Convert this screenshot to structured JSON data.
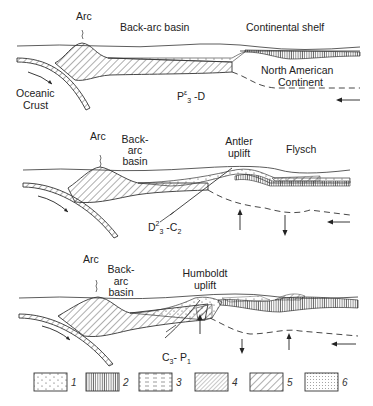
{
  "panels": [
    {
      "id": "panel-1",
      "age": {
        "base": "P",
        "sup": "ε",
        "sub": "3",
        "rest": " -D"
      },
      "labels": {
        "arc": "Arc",
        "back_arc_basin": "Back-arc basin",
        "continental_shelf": "Continental shelf",
        "continent_line1": "North  American",
        "continent_line2": "Continent",
        "oceanic_line1": "Oceanic",
        "oceanic_line2": "Crust"
      }
    },
    {
      "id": "panel-2",
      "age": {
        "base": "D",
        "sup": "2",
        "sub": "3",
        "rest": " -C",
        "sub2": "2"
      },
      "labels": {
        "arc": "Arc",
        "back_arc_line1": "Back-",
        "back_arc_line2": "arc",
        "back_arc_line3": "basin",
        "uplift_line1": "Antler",
        "uplift_line2": "uplift",
        "flysch": "Flysch"
      }
    },
    {
      "id": "panel-3",
      "age": {
        "base": "C",
        "sub": "3",
        "rest": "- P",
        "sub2": "1"
      },
      "labels": {
        "arc": "Arc",
        "back_arc_line1": "Back-",
        "back_arc_line2": "arc",
        "back_arc_line3": "basin",
        "uplift_line1": "Humboldt",
        "uplift_line2": "uplift"
      }
    }
  ],
  "legend": [
    {
      "num": "1",
      "pattern": "sparse-dots"
    },
    {
      "num": "2",
      "pattern": "vertical-lines"
    },
    {
      "num": "3",
      "pattern": "dashes"
    },
    {
      "num": "4",
      "pattern": "dense-crosshatch"
    },
    {
      "num": "5",
      "pattern": "diagonal-lines"
    },
    {
      "num": "6",
      "pattern": "dense-dots"
    }
  ]
}
